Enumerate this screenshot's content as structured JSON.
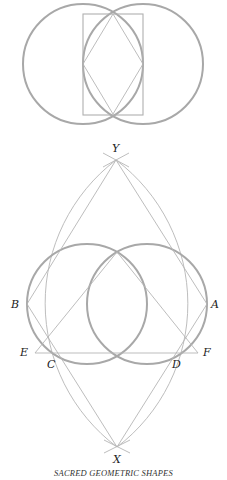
{
  "figure": {
    "caption": "SACRED GEOMETRIC SHAPES",
    "colors": {
      "circle_stroke": "#a8a8a8",
      "line_stroke": "#b5b5b5",
      "label_color": "#222222"
    }
  },
  "top_diagram": {
    "description": "Vesica piscis: two overlapping circles with inscribed rhombus and bounding rectangle",
    "circles": [
      {
        "cx": 83,
        "cy": 64,
        "r": 60
      },
      {
        "cx": 143,
        "cy": 64,
        "r": 60
      }
    ],
    "rectangle": {
      "x": 83,
      "y": 14,
      "w": 60,
      "h": 101
    },
    "rhombus": [
      [
        113,
        14
      ],
      [
        83,
        64
      ],
      [
        113,
        114
      ],
      [
        143,
        64
      ]
    ]
  },
  "bottom_diagram": {
    "labels": {
      "Y": "Y",
      "X": "X",
      "A": "A",
      "B": "B",
      "C": "C",
      "D": "D",
      "E": "E",
      "F": "F"
    },
    "points": {
      "Y": [
        116,
        160
      ],
      "X": [
        117,
        447
      ],
      "A": [
        207,
        304
      ],
      "B": [
        27,
        304
      ],
      "C": [
        58,
        354
      ],
      "D": [
        176,
        354
      ],
      "E": [
        35,
        353
      ],
      "F": [
        198,
        353
      ],
      "I": [
        117,
        252
      ]
    },
    "circles": [
      {
        "cx": 87,
        "cy": 304,
        "r": 60
      },
      {
        "cx": 147,
        "cy": 304,
        "r": 60
      }
    ]
  }
}
